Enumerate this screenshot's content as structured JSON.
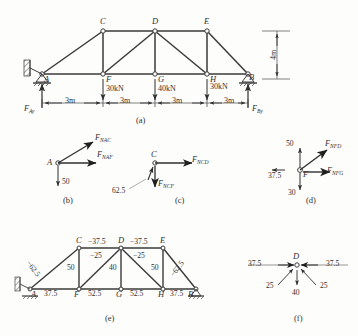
{
  "figure": {
    "title_caption_a": "(a)",
    "title_caption_b": "(b)",
    "title_caption_c": "(c)",
    "title_caption_d": "(d)",
    "title_caption_e": "(e)",
    "title_caption_f": "(f)"
  },
  "panel_a": {
    "nodes": {
      "A": "A",
      "B": "B",
      "C": "C",
      "D": "D",
      "E": "E",
      "F": "F",
      "G": "G",
      "H": "H"
    },
    "loads": [
      {
        "at": "F",
        "label": "30kN"
      },
      {
        "at": "G",
        "label": "40kN"
      },
      {
        "at": "H",
        "label": "30kN"
      }
    ],
    "reactions": {
      "left_main": "F",
      "left_sub": "Ay",
      "right_main": "F",
      "right_sub": "By"
    },
    "dimensions": {
      "span_1": "3m",
      "span_2": "3m",
      "span_3": "3m",
      "span_4": "3m",
      "height": "4m"
    }
  },
  "panel_b": {
    "joint": "A",
    "force_ac_main": "F",
    "force_ac_sub": "NAC",
    "force_af_main": "F",
    "force_af_sub": "NAF",
    "reaction_value": "50"
  },
  "panel_c": {
    "joint": "C",
    "force_cd_main": "F",
    "force_cd_sub": "NCD",
    "force_cf_main": "F",
    "force_cf_sub": "NCF",
    "known_value": "62.5"
  },
  "panel_d": {
    "joint": "F",
    "force_fd_main": "F",
    "force_fd_sub": "NFD",
    "force_fg_main": "F",
    "force_fg_sub": "NFG",
    "value_up": "50",
    "value_left": "37.5",
    "value_down": "30"
  },
  "panel_e": {
    "nodes": {
      "A": "A",
      "B": "B",
      "C": "C",
      "D": "D",
      "E": "E",
      "F": "F",
      "G": "G",
      "H": "H"
    },
    "members": {
      "AC": "−62.5",
      "CD": "−37.5",
      "DE": "−37.5",
      "EB": "−62.5",
      "CF": "50",
      "DG": "40",
      "EH": "50",
      "DF": "−25",
      "DH": "−25",
      "AF": "37.5",
      "FG": "52.5",
      "GH": "52.5",
      "HB": "37.5"
    }
  },
  "panel_f": {
    "joint": "D",
    "value_left": "37.5",
    "value_right": "37.5",
    "value_diag_left": "25",
    "value_diag_right": "25",
    "value_down": "40"
  }
}
